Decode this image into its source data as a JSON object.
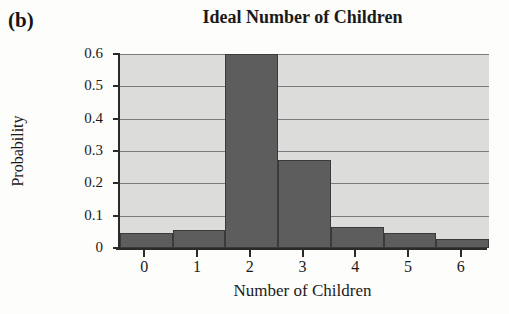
{
  "panel": {
    "label": "(b)"
  },
  "chart_data": {
    "type": "bar",
    "title": "Ideal Number of Children",
    "xlabel": "Number of Children",
    "ylabel": "Probability",
    "categories": [
      "0",
      "1",
      "2",
      "3",
      "4",
      "5",
      "6"
    ],
    "values": [
      0.045,
      0.055,
      0.6,
      0.272,
      0.066,
      0.045,
      0.028
    ],
    "ylim": [
      0,
      0.6
    ],
    "xlim": [
      -0.5,
      6.5
    ],
    "ytick_labels": [
      "0",
      "0.1",
      "0.2",
      "0.3",
      "0.4",
      "0.5",
      "0.6"
    ],
    "ytick_values": [
      0,
      0.1,
      0.2,
      0.3,
      0.4,
      0.5,
      0.6
    ],
    "xtick_labels": [
      "0",
      "1",
      "2",
      "3",
      "4",
      "5",
      "6"
    ],
    "grid": true,
    "legend": false,
    "bar_color": "#5d5d5d",
    "bar_edge_color": "#3a3a3a",
    "plot_background": "#dcdcda",
    "gridline_color": "#7b7b7b",
    "axis_color": "#2b2b2b",
    "text_color": "#1a1a1a"
  }
}
